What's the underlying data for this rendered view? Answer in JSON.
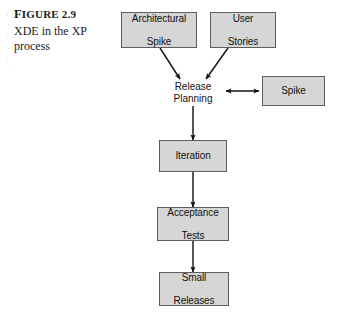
{
  "figure": {
    "label_prefix": "F",
    "label_rest": "IGURE",
    "label_number": "2.9",
    "caption": "XDE in the XP process"
  },
  "colors": {
    "box_fill": "#d6d6d6",
    "box_border": "#5d5d5d",
    "arrow": "#111111",
    "text": "#111111",
    "background": "#ffffff"
  },
  "diagram": {
    "type": "flowchart",
    "nodes": [
      {
        "id": "architectural-spike",
        "label_line1": "Architectural",
        "label_line2": "Spike",
        "boxed": true
      },
      {
        "id": "user-stories",
        "label_line1": "User",
        "label_line2": "Stories",
        "boxed": true
      },
      {
        "id": "release-planning",
        "label_line1": "Release",
        "label_line2": "Planning",
        "boxed": false
      },
      {
        "id": "spike",
        "label_line1": "Spike",
        "label_line2": "",
        "boxed": true
      },
      {
        "id": "iteration",
        "label_line1": "Iteration",
        "label_line2": "",
        "boxed": true
      },
      {
        "id": "acceptance-tests",
        "label_line1": "Acceptance",
        "label_line2": "Tests",
        "boxed": true
      },
      {
        "id": "small-releases",
        "label_line1": "Small",
        "label_line2": "Releases",
        "boxed": true
      }
    ],
    "edges": [
      {
        "from": "architectural-spike",
        "to": "release-planning",
        "style": "arrow"
      },
      {
        "from": "user-stories",
        "to": "release-planning",
        "style": "arrow"
      },
      {
        "from": "release-planning",
        "to": "spike",
        "style": "double-arrow"
      },
      {
        "from": "release-planning",
        "to": "iteration",
        "style": "arrow"
      },
      {
        "from": "iteration",
        "to": "acceptance-tests",
        "style": "arrow"
      },
      {
        "from": "acceptance-tests",
        "to": "small-releases",
        "style": "arrow"
      }
    ]
  }
}
